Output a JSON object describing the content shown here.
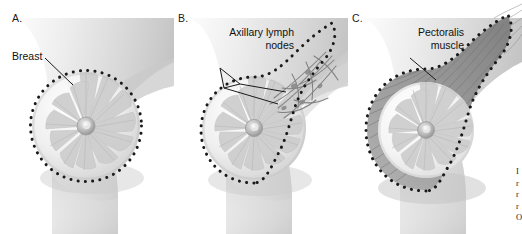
{
  "figure": {
    "background_color": "#ffffff",
    "ink_color": "#111111",
    "style": "grayscale medical illustration"
  },
  "panels": [
    {
      "id": "a",
      "letter": "A.",
      "label": "Breast",
      "label_lines": "Breast",
      "description": "Sagittal cross-section of the breast with radial lobules and central nipple, enclosed by a dotted boundary marking breast tissue extent.",
      "dotted_outline": "circular",
      "leader_line": true
    },
    {
      "id": "b",
      "letter": "B.",
      "label": "Axillary lymph nodes",
      "label_lines": "Axillary lymph\nnodes",
      "description": "Breast tissue boundary extended as a tail toward the axilla, enclosing the branching axillary lymphatic vessels and nodes.",
      "dotted_outline": "teardrop extending to axilla",
      "leader_line": true,
      "pointer": "v-shaped"
    },
    {
      "id": "c",
      "letter": "C.",
      "label": "Pectoralis muscle",
      "label_lines": "Pectoralis\nmuscle",
      "description": "Breast with the underlying pectoralis muscle layer shown as a darker gray band beneath the dotted boundary, fibers fanning toward the axilla.",
      "dotted_outline": "teardrop enclosing muscle layer",
      "leader_line": true
    }
  ],
  "edge_caption": {
    "visible_fragment": "I\nr\nr\nr\nO",
    "note": "caption text clipped at the right edge of the image",
    "lines": 5
  },
  "colors": {
    "background": "#ffffff",
    "text": "#111111",
    "dotted_outline": "#1a1a1a",
    "skin_light": "#f2f2f2",
    "skin_mid": "#d8d8d8",
    "skin_shadow": "#b4b4b4",
    "tissue_light": "#fbfbfb",
    "tissue_mid": "#d2d2d2",
    "lobule": "#c6c6c6",
    "muscle": "#9a9a9a",
    "vessel": "#6f6f6f"
  }
}
